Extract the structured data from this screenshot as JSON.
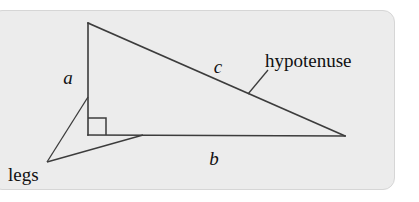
{
  "figure": {
    "panel": {
      "background_color": "#ececec",
      "border_color": "#d6d6d6",
      "page_background_color": "#ffffff"
    },
    "line_color": "#3c3c3c",
    "text_color": "#111111",
    "labels": {
      "leg_a": "a",
      "leg_b": "b",
      "hypotenuse_side": "c",
      "hypotenuse_word": "hypotenuse",
      "legs_word": "legs"
    },
    "geometry": {
      "apex": [
        88,
        23
      ],
      "right_angle_vertex": [
        88,
        135
      ],
      "right_vertex": [
        345,
        136
      ],
      "right_angle_marker": [
        88,
        118,
        18,
        17
      ],
      "legs_callout_point": [
        47,
        162
      ],
      "legs_callout_target_a": [
        88,
        97
      ],
      "legs_callout_target_b": [
        143,
        135
      ],
      "hypotenuse_leader_start": [
        268,
        70
      ],
      "hypotenuse_leader_end": [
        248,
        94
      ]
    }
  }
}
